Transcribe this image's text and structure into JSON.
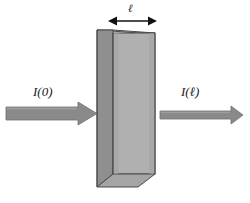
{
  "figure": {
    "name": "beer-lambert-absorption-diagram",
    "background_color": "#ffffff",
    "width": 250,
    "height": 203
  },
  "labels": {
    "incident_intensity": "I(0)",
    "transmitted_intensity": "I(ℓ)",
    "path_length": "ℓ"
  },
  "colors": {
    "arrow_fill": "#8a8a8a",
    "arrow_stroke": "#6f6f6f",
    "cuvette_front": "#b0b0b0",
    "cuvette_side": "#8f8f8f",
    "cuvette_top": "#bcbcbc",
    "cuvette_bottom": "#a5a5a5",
    "outline": "#4a4a4a",
    "dimension_arrow": "#111111",
    "text": "#1a1a1a"
  },
  "elements": {
    "incident_beam_arrow": "thick-right-arrow",
    "transmitted_beam_arrow": "thin-right-arrow",
    "path_length_dimension": "double-headed-arrow",
    "sample_cell": "3d-rectangular-cuvette"
  }
}
